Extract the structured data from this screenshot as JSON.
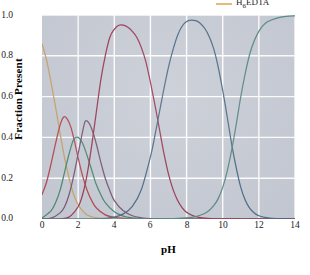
{
  "chart_data": {
    "type": "line",
    "title": "",
    "xlabel": "pH",
    "ylabel": "Fraction Present",
    "xlim": [
      0,
      14
    ],
    "ylim": [
      0.0,
      1.0
    ],
    "xticks": [
      "0",
      "2",
      "4",
      "6",
      "8",
      "10",
      "12",
      "14"
    ],
    "yticks": [
      "0.0",
      "0.2",
      "0.4",
      "0.6",
      "0.8",
      "1.0"
    ],
    "grid": true,
    "legend_position": "top-right",
    "background_color": "#c8ccd6",
    "gridline_color": "#ffffff",
    "series": [
      {
        "name": "H6EDTA",
        "color": "#c9a36a",
        "peak_pH": 0.0,
        "peak_value": 0.86,
        "pKa": 0.9,
        "x": [
          0.0,
          0.25,
          0.5,
          0.75,
          1.0,
          1.25,
          1.5,
          1.75,
          2.0,
          2.25,
          2.5,
          2.75,
          3.0,
          3.5,
          4.0,
          5.0,
          6.0,
          8.0,
          10.0,
          12.0,
          14.0
        ],
        "y": [
          0.86,
          0.78,
          0.67,
          0.55,
          0.42,
          0.3,
          0.2,
          0.12,
          0.07,
          0.04,
          0.02,
          0.011,
          0.006,
          0.002,
          0.0,
          0.0,
          0.0,
          0.0,
          0.0,
          0.0,
          0.0
        ]
      },
      {
        "name": "H5EDTA+",
        "color": "#b54a52",
        "peak_pH": 1.2,
        "peak_value": 0.5,
        "pKa": 1.6,
        "x": [
          0.0,
          0.25,
          0.5,
          0.75,
          1.0,
          1.2,
          1.4,
          1.6,
          1.8,
          2.0,
          2.25,
          2.5,
          2.75,
          3.0,
          3.5,
          4.0,
          5.0,
          6.0,
          8.0,
          10.0,
          12.0,
          14.0
        ],
        "y": [
          0.12,
          0.18,
          0.27,
          0.37,
          0.46,
          0.5,
          0.49,
          0.45,
          0.38,
          0.3,
          0.21,
          0.14,
          0.09,
          0.055,
          0.02,
          0.008,
          0.001,
          0.0,
          0.0,
          0.0,
          0.0,
          0.0
        ]
      },
      {
        "name": "H4EDTA",
        "color": "#4e8a72",
        "peak_pH": 1.8,
        "peak_value": 0.4,
        "pKa": 2.0,
        "x": [
          0.0,
          0.5,
          0.75,
          1.0,
          1.25,
          1.5,
          1.75,
          2.0,
          2.25,
          2.5,
          2.75,
          3.0,
          3.25,
          3.5,
          4.0,
          4.5,
          5.0,
          6.0,
          8.0,
          10.0,
          12.0,
          14.0
        ],
        "y": [
          0.005,
          0.04,
          0.08,
          0.14,
          0.23,
          0.32,
          0.39,
          0.4,
          0.37,
          0.31,
          0.24,
          0.17,
          0.12,
          0.08,
          0.035,
          0.014,
          0.006,
          0.001,
          0.0,
          0.0,
          0.0,
          0.0
        ]
      },
      {
        "name": "H3EDTA-",
        "color": "#7a5a76",
        "peak_pH": 2.4,
        "peak_value": 0.48,
        "pKa": 2.7,
        "x": [
          0.0,
          0.5,
          1.0,
          1.25,
          1.5,
          1.75,
          2.0,
          2.25,
          2.4,
          2.6,
          2.8,
          3.0,
          3.25,
          3.5,
          3.75,
          4.0,
          4.5,
          5.0,
          5.5,
          6.0,
          7.0,
          8.0,
          10.0,
          12.0,
          14.0
        ],
        "y": [
          0.0,
          0.004,
          0.03,
          0.06,
          0.12,
          0.21,
          0.32,
          0.43,
          0.48,
          0.47,
          0.43,
          0.37,
          0.28,
          0.2,
          0.14,
          0.09,
          0.04,
          0.016,
          0.006,
          0.002,
          0.0,
          0.0,
          0.0,
          0.0,
          0.0
        ]
      },
      {
        "name": "H2EDTA2-",
        "color": "#9b3a55",
        "peak_pH": 4.4,
        "peak_value": 0.95,
        "pKa": 6.16,
        "x": [
          0.0,
          1.0,
          1.5,
          2.0,
          2.25,
          2.5,
          2.75,
          3.0,
          3.25,
          3.5,
          3.75,
          4.0,
          4.25,
          4.5,
          4.75,
          5.0,
          5.25,
          5.5,
          5.75,
          6.0,
          6.25,
          6.5,
          6.75,
          7.0,
          7.25,
          7.5,
          7.75,
          8.0,
          8.25,
          8.5,
          9.0,
          9.5,
          10.0,
          11.0,
          12.0,
          14.0
        ],
        "y": [
          0.0,
          0.001,
          0.01,
          0.06,
          0.12,
          0.22,
          0.36,
          0.52,
          0.68,
          0.8,
          0.89,
          0.93,
          0.95,
          0.95,
          0.94,
          0.92,
          0.89,
          0.84,
          0.77,
          0.67,
          0.56,
          0.44,
          0.32,
          0.22,
          0.145,
          0.092,
          0.056,
          0.033,
          0.02,
          0.012,
          0.004,
          0.0015,
          0.0005,
          0.0,
          0.0,
          0.0
        ]
      },
      {
        "name": "HEDTA3-",
        "color": "#4f6c86",
        "peak_pH": 8.2,
        "peak_value": 0.98,
        "pKa": 10.26,
        "x": [
          0.0,
          2.0,
          3.0,
          3.5,
          4.0,
          4.5,
          5.0,
          5.5,
          6.0,
          6.25,
          6.5,
          6.75,
          7.0,
          7.25,
          7.5,
          7.75,
          8.0,
          8.25,
          8.5,
          8.75,
          9.0,
          9.25,
          9.5,
          9.75,
          10.0,
          10.25,
          10.5,
          10.75,
          11.0,
          11.25,
          11.5,
          11.75,
          12.0,
          12.5,
          13.0,
          14.0
        ],
        "y": [
          0.0,
          0.0,
          0.001,
          0.003,
          0.009,
          0.025,
          0.062,
          0.145,
          0.305,
          0.41,
          0.525,
          0.64,
          0.745,
          0.83,
          0.9,
          0.945,
          0.968,
          0.975,
          0.972,
          0.96,
          0.935,
          0.895,
          0.835,
          0.745,
          0.63,
          0.5,
          0.365,
          0.25,
          0.155,
          0.092,
          0.052,
          0.029,
          0.016,
          0.005,
          0.0015,
          0.0
        ]
      },
      {
        "name": "EDTA4-",
        "color": "#5a8a85",
        "peak_pH": 14.0,
        "peak_value": 1.0,
        "pKa": null,
        "x": [
          0.0,
          5.0,
          6.0,
          7.0,
          8.0,
          8.5,
          9.0,
          9.25,
          9.5,
          9.75,
          10.0,
          10.25,
          10.5,
          10.75,
          11.0,
          11.25,
          11.5,
          11.75,
          12.0,
          12.25,
          12.5,
          13.0,
          13.5,
          14.0
        ],
        "y": [
          0.0,
          0.0,
          0.0,
          0.001,
          0.006,
          0.012,
          0.027,
          0.042,
          0.065,
          0.1,
          0.155,
          0.235,
          0.34,
          0.465,
          0.6,
          0.715,
          0.81,
          0.875,
          0.92,
          0.95,
          0.968,
          0.985,
          0.993,
          0.996
        ]
      }
    ]
  },
  "legend": {
    "entries": [
      {
        "label_prefix": "H",
        "label_sub": "6",
        "label_suffix": "EDTA",
        "color": "#e8b87a",
        "swatch_icon": "line-swatch"
      }
    ]
  },
  "axes": {
    "x": {
      "title": "pH",
      "ticks": [
        "0",
        "2",
        "4",
        "6",
        "8",
        "10",
        "12",
        "14"
      ]
    },
    "y": {
      "title": "Fraction Present",
      "ticks": [
        "1.0",
        "0.8",
        "0.6",
        "0.4",
        "0.2",
        "0.0"
      ]
    }
  }
}
